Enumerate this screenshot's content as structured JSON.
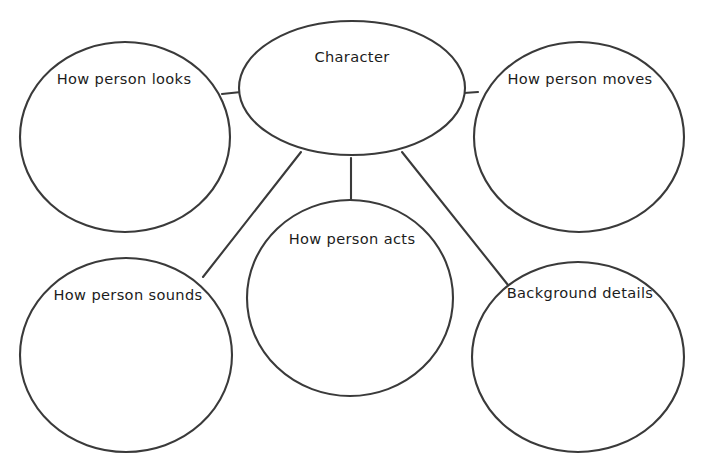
{
  "diagram": {
    "kind": "web-graphic-organizer",
    "center": {
      "id": "character",
      "label": "Character",
      "shape": "ellipse",
      "cx": 352,
      "cy": 88,
      "rx": 113,
      "ry": 67,
      "text_x": 352,
      "text_y": 58
    },
    "nodes": [
      {
        "id": "how-person-looks",
        "label": "How person looks",
        "shape": "circle",
        "cx": 125,
        "cy": 137,
        "rx": 105,
        "ry": 95,
        "text_x": 124,
        "text_y": 80
      },
      {
        "id": "how-person-moves",
        "label": "How person moves",
        "shape": "circle",
        "cx": 579,
        "cy": 137,
        "rx": 105,
        "ry": 95,
        "text_x": 580,
        "text_y": 80
      },
      {
        "id": "how-person-sounds",
        "label": "How person sounds",
        "shape": "circle",
        "cx": 126,
        "cy": 355,
        "rx": 106,
        "ry": 97,
        "text_x": 128,
        "text_y": 296
      },
      {
        "id": "how-person-acts",
        "label": "How person acts",
        "shape": "circle",
        "cx": 350,
        "cy": 298,
        "rx": 103,
        "ry": 98,
        "text_x": 352,
        "text_y": 240
      },
      {
        "id": "background-details",
        "label": "Background details",
        "shape": "circle",
        "cx": 578,
        "cy": 357,
        "rx": 106,
        "ry": 95,
        "text_x": 580,
        "text_y": 294
      }
    ],
    "connectors": [
      {
        "id": "center-to-looks",
        "from": "character",
        "to": "how-person-looks",
        "x1": 241,
        "y1": 92,
        "x2": 222,
        "y2": 94
      },
      {
        "id": "center-to-moves",
        "from": "character",
        "to": "how-person-moves",
        "x1": 464,
        "y1": 93,
        "x2": 478,
        "y2": 92
      },
      {
        "id": "center-to-acts",
        "from": "character",
        "to": "how-person-acts",
        "x1": 351,
        "y1": 158,
        "x2": 351,
        "y2": 202
      },
      {
        "id": "center-to-sounds",
        "from": "character",
        "to": "how-person-sounds",
        "x1": 301,
        "y1": 152,
        "x2": 203,
        "y2": 277
      },
      {
        "id": "center-to-background",
        "from": "character",
        "to": "background-details",
        "x1": 402,
        "y1": 152,
        "x2": 508,
        "y2": 285
      }
    ],
    "colors": {
      "stroke": "#3a3a3a",
      "fill": "#ffffff",
      "text": "#1c1c1c",
      "background": "#ffffff"
    }
  }
}
